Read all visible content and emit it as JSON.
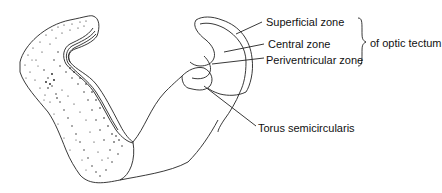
{
  "diagram": {
    "labels": {
      "superficial_zone": "Superficial zone",
      "central_zone": "Central zone",
      "periventricular_zone": "Periventricular zone",
      "group_label": "of optic tectum",
      "torus": "Torus semicircularis"
    },
    "colors": {
      "line": "#222222",
      "stipple": "#1a1a1a",
      "background": "#ffffff"
    }
  }
}
